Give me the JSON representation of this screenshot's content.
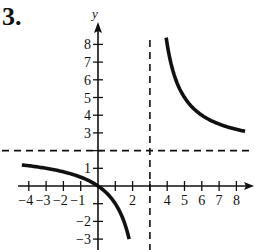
{
  "problem": {
    "number": "3."
  },
  "chart_data": {
    "type": "line",
    "title": "",
    "xlabel": "",
    "ylabel": "y",
    "xlim": [
      -4.5,
      9
    ],
    "ylim": [
      -3.7,
      9
    ],
    "grid": false,
    "x_ticks": [
      -4,
      -3,
      -2,
      -1,
      1,
      2,
      3,
      4,
      5,
      6,
      7,
      8
    ],
    "x_tick_labels": [
      "-4",
      "-3",
      "-2",
      "-1",
      "2",
      "4",
      "5",
      "6",
      "7",
      "8"
    ],
    "y_ticks": [
      -3,
      -2,
      -1,
      1,
      2,
      3,
      4,
      5,
      6,
      7,
      8
    ],
    "y_tick_labels": [
      "-3",
      "-2",
      "1",
      "3",
      "4",
      "5",
      "6",
      "7",
      "8"
    ],
    "asymptotes": [
      {
        "type": "vertical",
        "x": 3,
        "style": "dashed"
      },
      {
        "type": "horizontal",
        "y": 2,
        "style": "dashed"
      }
    ],
    "series": [
      {
        "name": "left-branch",
        "function": "2x/(x-3)",
        "x": [
          -4.4,
          -4,
          -3,
          -2,
          -1,
          0,
          0.5,
          1,
          1.5,
          1.8
        ],
        "y": [
          1.19,
          1.14,
          1.0,
          0.8,
          0.5,
          0,
          -0.4,
          -1.0,
          -2.0,
          -3.0
        ]
      },
      {
        "name": "right-branch",
        "function": "2x/(x-3)",
        "x": [
          3.94,
          4,
          4.5,
          5,
          6,
          7,
          8,
          8.5
        ],
        "y": [
          8.4,
          8.0,
          6.0,
          5.0,
          4.0,
          3.5,
          3.2,
          3.09
        ]
      }
    ]
  }
}
